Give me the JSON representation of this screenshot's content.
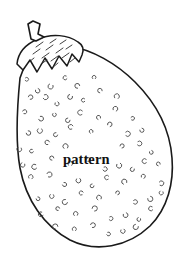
{
  "image": {
    "kind": "line-art-coloring-page",
    "subject": "eggplant",
    "caption": "pattern",
    "background_color": "#ffffff",
    "outline_color": "#1a1a1a",
    "speckle_color": "#4a4a4a",
    "hatch_color": "#2b2b2b",
    "caption_color": "#111111",
    "width": 188,
    "height": 259
  },
  "parts": {
    "stem_name": "stem",
    "calyx_name": "calyx",
    "body_name": "eggplant-body",
    "speckles_name": "speckle-marks",
    "hatching_name": "calyx-hatching"
  },
  "geometry": {
    "body_path": "M 20 78 C 17 108, 15 140, 20 168 C 26 200, 44 226, 70 240 C 96 253, 128 247, 150 226 C 168 208, 174 182, 172 158 C 170 130, 157 104, 135 82 C 116 63, 92 50, 70 46 C 50 43, 33 52, 26 62 Z",
    "calyx_path": "M 17 64 C 18 53, 26 44, 38 39 C 52 33, 68 35, 78 42 C 83 45, 84 50, 82 55 L 79 62 L 72 54 L 67 66 L 59 56 L 52 69 L 45 58 L 37 72 L 30 60 L 23 70 Z",
    "stem_path": "M 31 39 L 28 24 L 33 21 L 40 24 L 38 34 L 44 37 L 36 41 Z",
    "hatch_lines": [
      [
        33,
        54,
        40,
        49
      ],
      [
        42,
        58,
        49,
        53
      ],
      [
        51,
        61,
        58,
        56
      ],
      [
        36,
        47,
        43,
        42
      ],
      [
        46,
        50,
        53,
        45
      ],
      [
        56,
        53,
        63,
        48
      ],
      [
        41,
        64,
        47,
        60
      ],
      [
        52,
        68,
        58,
        63
      ],
      [
        62,
        58,
        69,
        53
      ],
      [
        66,
        49,
        72,
        45
      ],
      [
        60,
        44,
        66,
        40
      ],
      [
        29,
        62,
        34,
        58
      ],
      [
        70,
        62,
        75,
        58
      ],
      [
        50,
        43,
        56,
        39
      ]
    ],
    "speckles": [
      [
        24,
        79
      ],
      [
        36,
        88
      ],
      [
        52,
        83
      ],
      [
        68,
        77
      ],
      [
        80,
        88
      ],
      [
        94,
        80
      ],
      [
        28,
        99
      ],
      [
        42,
        96
      ],
      [
        56,
        101
      ],
      [
        72,
        94
      ],
      [
        86,
        100
      ],
      [
        102,
        93
      ],
      [
        116,
        100
      ],
      [
        22,
        113
      ],
      [
        38,
        117
      ],
      [
        54,
        112
      ],
      [
        70,
        118
      ],
      [
        84,
        113
      ],
      [
        100,
        120
      ],
      [
        114,
        112
      ],
      [
        130,
        119
      ],
      [
        26,
        131
      ],
      [
        40,
        127
      ],
      [
        58,
        133
      ],
      [
        74,
        128
      ],
      [
        92,
        134
      ],
      [
        108,
        127
      ],
      [
        124,
        134
      ],
      [
        140,
        128
      ],
      [
        20,
        146
      ],
      [
        34,
        150
      ],
      [
        50,
        144
      ],
      [
        66,
        150
      ],
      [
        120,
        148
      ],
      [
        136,
        143
      ],
      [
        150,
        150
      ],
      [
        24,
        162
      ],
      [
        38,
        166
      ],
      [
        54,
        160
      ],
      [
        70,
        167
      ],
      [
        86,
        161
      ],
      [
        102,
        168
      ],
      [
        118,
        162
      ],
      [
        134,
        167
      ],
      [
        148,
        161
      ],
      [
        160,
        166
      ],
      [
        30,
        180
      ],
      [
        46,
        176
      ],
      [
        62,
        183
      ],
      [
        78,
        177
      ],
      [
        94,
        184
      ],
      [
        110,
        178
      ],
      [
        126,
        185
      ],
      [
        142,
        179
      ],
      [
        158,
        184
      ],
      [
        36,
        197
      ],
      [
        52,
        193
      ],
      [
        68,
        200
      ],
      [
        84,
        194
      ],
      [
        100,
        201
      ],
      [
        116,
        195
      ],
      [
        132,
        202
      ],
      [
        148,
        196
      ],
      [
        162,
        190
      ],
      [
        44,
        213
      ],
      [
        60,
        210
      ],
      [
        76,
        217
      ],
      [
        92,
        211
      ],
      [
        108,
        218
      ],
      [
        124,
        212
      ],
      [
        140,
        217
      ],
      [
        154,
        208
      ],
      [
        58,
        229
      ],
      [
        74,
        232
      ],
      [
        90,
        227
      ],
      [
        106,
        233
      ],
      [
        122,
        228
      ],
      [
        138,
        224
      ]
    ],
    "caption_x": 63,
    "caption_y": 164
  }
}
